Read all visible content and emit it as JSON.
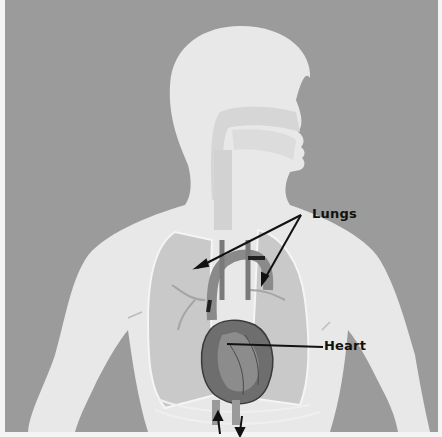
{
  "figure": {
    "background_color": "#9a9a9a",
    "body_color": "#e9e9e9",
    "organ_color": "#c8c8c8",
    "line_color": "#111111"
  },
  "labels": {
    "lungs": "Lungs",
    "heart": "Heart"
  }
}
